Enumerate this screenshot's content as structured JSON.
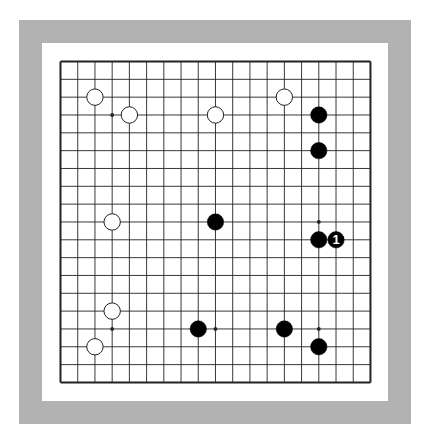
{
  "board": {
    "size": 19,
    "origin_x": 60.5,
    "origin_y": 61.5,
    "step_x": 17.22,
    "step_y": 17.83,
    "stone_radius": 8.2,
    "colors": {
      "frame": "#b2b2b2",
      "background": "#ffffff",
      "line": "#222222",
      "black_stone": "#000000",
      "white_stone": "#ffffff",
      "white_stone_edge": "#222222",
      "label_on_black": "#ffffff"
    },
    "star_points": [
      {
        "col": 3,
        "row": 3
      },
      {
        "col": 15,
        "row": 9
      },
      {
        "col": 3,
        "row": 15
      },
      {
        "col": 9,
        "row": 15
      },
      {
        "col": 15,
        "row": 15
      }
    ],
    "stones": [
      {
        "color": "white",
        "col": 2,
        "row": 2
      },
      {
        "color": "white",
        "col": 4,
        "row": 3
      },
      {
        "color": "white",
        "col": 9,
        "row": 3
      },
      {
        "color": "white",
        "col": 13,
        "row": 2
      },
      {
        "color": "white",
        "col": 3,
        "row": 9
      },
      {
        "color": "white",
        "col": 3,
        "row": 14
      },
      {
        "color": "white",
        "col": 2,
        "row": 16
      },
      {
        "color": "black",
        "col": 15,
        "row": 3
      },
      {
        "color": "black",
        "col": 15,
        "row": 5
      },
      {
        "color": "black",
        "col": 9,
        "row": 9
      },
      {
        "color": "black",
        "col": 15,
        "row": 10
      },
      {
        "color": "black",
        "col": 16,
        "row": 10,
        "label": "1"
      },
      {
        "color": "black",
        "col": 8,
        "row": 15
      },
      {
        "color": "black",
        "col": 13,
        "row": 15
      },
      {
        "color": "black",
        "col": 15,
        "row": 16
      }
    ]
  }
}
